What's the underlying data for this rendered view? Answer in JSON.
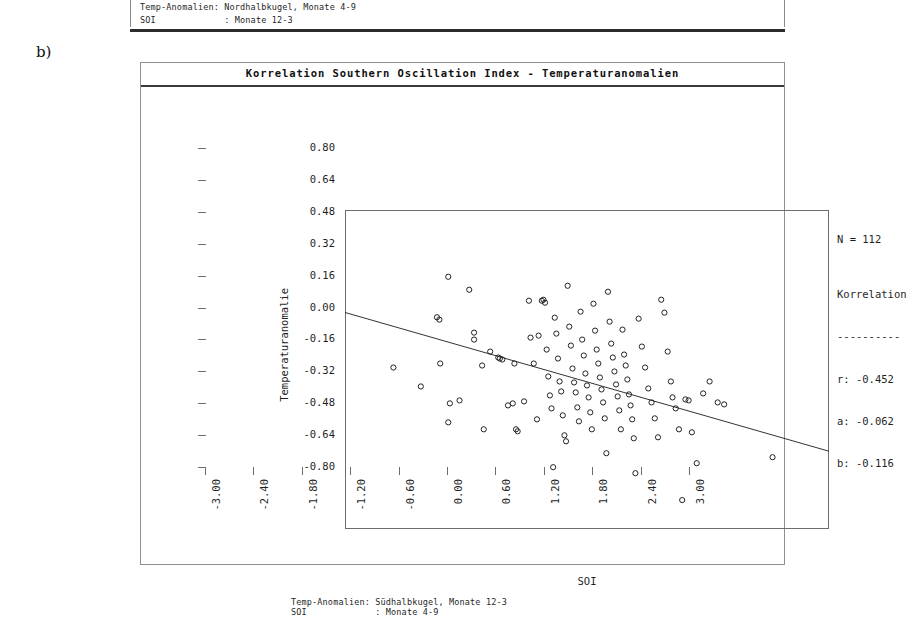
{
  "panel_letter": "b)",
  "top_fragment": {
    "line1": "Temp-Anomalien: Nordhalbkugel, Monate 4-9",
    "line2": "SOI             : Monate 12-3"
  },
  "figure": {
    "title": "Korrelation Southern Oscillation Index - Temperaturanomalien",
    "caption_line1": "Temp-Anomalien: Südhalbkugel, Monate 12-3",
    "caption_line2": "SOI             : Monate 4-9"
  },
  "stats": {
    "n_label": "N = 112",
    "heading": "Korrelation",
    "rule": "----------",
    "r": "r: -0.452",
    "a": "a: -0.062",
    "b": "b: -0.116"
  },
  "chart_data": {
    "type": "scatter",
    "title": "Korrelation Southern Oscillation Index - Temperaturanomalien",
    "xlabel": "SOI",
    "ylabel": "Temperaturanomalie",
    "xlim": [
      -3.0,
      3.0
    ],
    "ylim": [
      -0.8,
      0.8
    ],
    "xticks": [
      "-3.00",
      "-2.40",
      "-1.80",
      "-1.20",
      "-0.60",
      "0.00",
      "0.60",
      "1.20",
      "1.80",
      "2.40",
      "3.00"
    ],
    "xtick_values": [
      -3.0,
      -2.4,
      -1.8,
      -1.2,
      -0.6,
      0.0,
      0.6,
      1.2,
      1.8,
      2.4,
      3.0
    ],
    "yticks": [
      "0.80",
      "0.64",
      "0.48",
      "0.32",
      "0.16",
      "0.00",
      "-0.16",
      "-0.32",
      "-0.48",
      "-0.64",
      "-0.80"
    ],
    "ytick_values": [
      0.8,
      0.64,
      0.48,
      0.32,
      0.16,
      0.0,
      -0.16,
      -0.32,
      -0.48,
      -0.64,
      -0.8
    ],
    "grid": false,
    "legend": "none",
    "n": 112,
    "correlation_r": -0.452,
    "intercept_a": -0.062,
    "slope_b": -0.116,
    "fit_line": {
      "x0": -3.0,
      "y0": 0.286,
      "x1": 3.0,
      "y1": -0.41
    },
    "marker": "open-circle",
    "points": [
      [
        -1.72,
        0.465
      ],
      [
        -2.4,
        0.01
      ],
      [
        -1.46,
        0.4
      ],
      [
        -1.86,
        0.262
      ],
      [
        -1.83,
        0.25
      ],
      [
        -2.06,
        -0.085
      ],
      [
        -1.7,
        -0.17
      ],
      [
        -1.58,
        -0.155
      ],
      [
        -1.4,
        0.185
      ],
      [
        -1.4,
        0.15
      ],
      [
        -1.3,
        0.02
      ],
      [
        -1.82,
        0.03
      ],
      [
        -1.72,
        -0.265
      ],
      [
        -1.2,
        0.09
      ],
      [
        -1.1,
        0.06
      ],
      [
        -1.08,
        0.055
      ],
      [
        -1.05,
        0.05
      ],
      [
        -0.98,
        -0.18
      ],
      [
        -0.92,
        -0.17
      ],
      [
        -0.9,
        0.03
      ],
      [
        -0.88,
        -0.3
      ],
      [
        -0.86,
        -0.31
      ],
      [
        -0.78,
        -0.16
      ],
      [
        -0.72,
        0.345
      ],
      [
        -0.7,
        0.16
      ],
      [
        -0.66,
        0.03
      ],
      [
        -0.62,
        -0.25
      ],
      [
        -0.6,
        0.17
      ],
      [
        -0.56,
        0.345
      ],
      [
        -0.54,
        0.35
      ],
      [
        -0.52,
        0.335
      ],
      [
        -0.5,
        0.1
      ],
      [
        -0.48,
        -0.035
      ],
      [
        -0.46,
        -0.13
      ],
      [
        -0.44,
        -0.195
      ],
      [
        -0.42,
        -0.49
      ],
      [
        -0.4,
        0.26
      ],
      [
        -0.38,
        0.18
      ],
      [
        -0.36,
        0.055
      ],
      [
        -0.34,
        -0.06
      ],
      [
        -0.32,
        -0.11
      ],
      [
        -0.3,
        -0.23
      ],
      [
        -0.28,
        -0.33
      ],
      [
        -0.26,
        -0.36
      ],
      [
        -0.24,
        0.42
      ],
      [
        -0.22,
        0.215
      ],
      [
        -0.2,
        0.12
      ],
      [
        -0.18,
        0.005
      ],
      [
        -0.16,
        -0.065
      ],
      [
        -0.14,
        -0.115
      ],
      [
        -0.12,
        -0.19
      ],
      [
        -0.1,
        -0.26
      ],
      [
        -0.08,
        0.29
      ],
      [
        -0.06,
        0.15
      ],
      [
        -0.04,
        0.07
      ],
      [
        -0.02,
        -0.02
      ],
      [
        0.0,
        -0.08
      ],
      [
        0.02,
        -0.14
      ],
      [
        0.04,
        -0.215
      ],
      [
        0.06,
        -0.3
      ],
      [
        0.08,
        0.33
      ],
      [
        0.1,
        0.195
      ],
      [
        0.12,
        0.1
      ],
      [
        0.14,
        0.03
      ],
      [
        0.16,
        -0.04
      ],
      [
        0.18,
        -0.1
      ],
      [
        0.2,
        -0.165
      ],
      [
        0.22,
        -0.245
      ],
      [
        0.24,
        -0.42
      ],
      [
        0.26,
        0.39
      ],
      [
        0.28,
        0.24
      ],
      [
        0.3,
        0.13
      ],
      [
        0.32,
        0.06
      ],
      [
        0.34,
        -0.01
      ],
      [
        0.36,
        -0.075
      ],
      [
        0.38,
        -0.135
      ],
      [
        0.4,
        -0.205
      ],
      [
        0.42,
        -0.3
      ],
      [
        0.44,
        0.2
      ],
      [
        0.46,
        0.075
      ],
      [
        0.48,
        0.02
      ],
      [
        0.5,
        -0.05
      ],
      [
        0.52,
        -0.125
      ],
      [
        0.54,
        -0.18
      ],
      [
        0.56,
        -0.25
      ],
      [
        0.58,
        -0.345
      ],
      [
        0.6,
        -0.52
      ],
      [
        0.64,
        0.255
      ],
      [
        0.68,
        0.115
      ],
      [
        0.72,
        0.01
      ],
      [
        0.76,
        -0.095
      ],
      [
        0.8,
        -0.165
      ],
      [
        0.84,
        -0.245
      ],
      [
        0.88,
        -0.34
      ],
      [
        0.92,
        0.35
      ],
      [
        0.96,
        0.285
      ],
      [
        1.0,
        0.09
      ],
      [
        1.04,
        -0.06
      ],
      [
        1.06,
        -0.14
      ],
      [
        1.1,
        -0.195
      ],
      [
        1.14,
        -0.3
      ],
      [
        1.18,
        -0.655
      ],
      [
        1.22,
        -0.15
      ],
      [
        1.26,
        -0.155
      ],
      [
        1.3,
        -0.315
      ],
      [
        1.36,
        -0.47
      ],
      [
        1.44,
        -0.12
      ],
      [
        1.52,
        -0.06
      ],
      [
        1.62,
        -0.165
      ],
      [
        1.7,
        -0.175
      ],
      [
        2.3,
        -0.44
      ],
      [
        -1.28,
        -0.3
      ]
    ]
  }
}
